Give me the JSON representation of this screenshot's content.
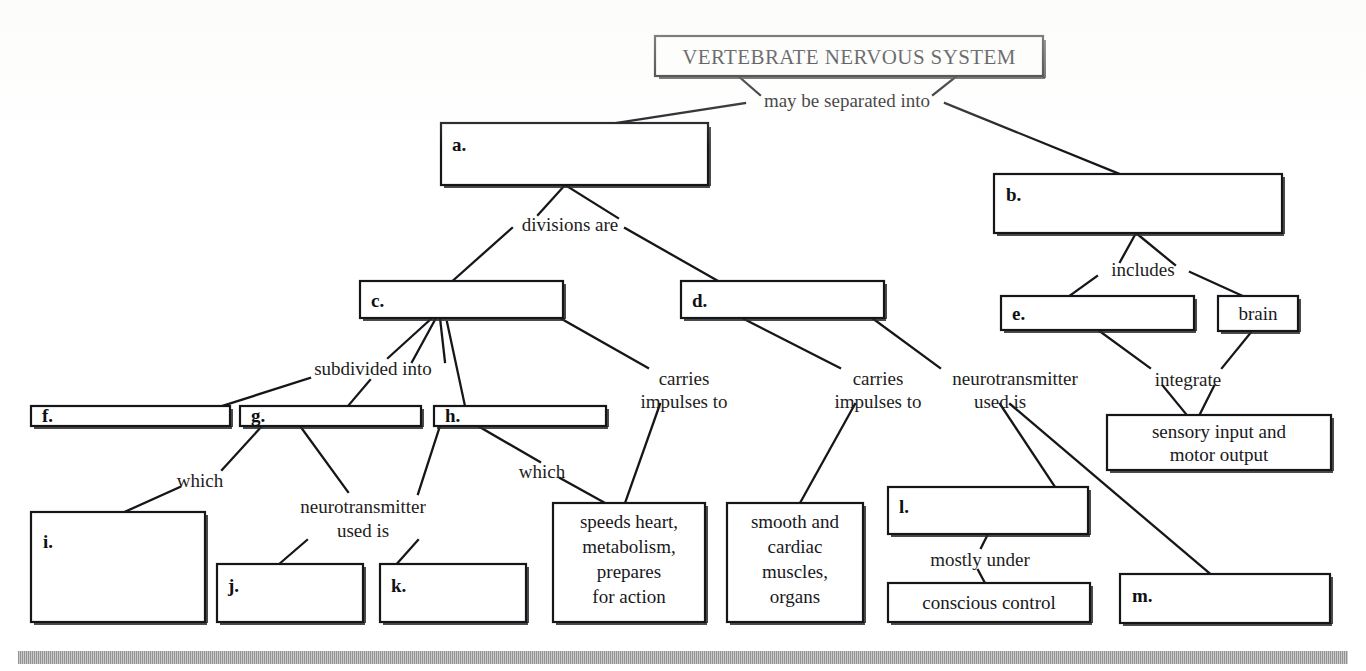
{
  "title": "VERTEBRATE NERVOUS SYSTEM",
  "document": {
    "type": "concept-map-worksheet",
    "footer_rule": true
  },
  "colors": {
    "stroke": "#15161a",
    "text": "#18181b",
    "page_background": "#ffffff",
    "footer_bar": "#9a9a9a"
  },
  "nodes": {
    "root": {
      "text": "VERTEBRATE NERVOUS SYSTEM",
      "key": "",
      "filled": true
    },
    "a": {
      "key": "a.",
      "text": "",
      "filled": false
    },
    "b": {
      "key": "b.",
      "text": "",
      "filled": false
    },
    "c": {
      "key": "c.",
      "text": "",
      "filled": false
    },
    "d": {
      "key": "d.",
      "text": "",
      "filled": false
    },
    "e": {
      "key": "e.",
      "text": "",
      "filled": false
    },
    "brain": {
      "key": "",
      "text": "brain",
      "filled": true
    },
    "f": {
      "key": "f.",
      "text": "",
      "filled": false
    },
    "g": {
      "key": "g.",
      "text": "",
      "filled": false
    },
    "h": {
      "key": "h.",
      "text": "",
      "filled": false
    },
    "i": {
      "key": "i.",
      "text": "",
      "filled": false
    },
    "j": {
      "key": "j.",
      "text": "",
      "filled": false
    },
    "k": {
      "key": "k.",
      "text": "",
      "filled": false
    },
    "l": {
      "key": "l.",
      "text": "",
      "filled": false
    },
    "m": {
      "key": "m.",
      "text": "",
      "filled": false
    },
    "sensory_motor": {
      "key": "",
      "filled": true,
      "lines": [
        "sensory input and",
        "motor output"
      ]
    },
    "speeds_heart": {
      "key": "",
      "filled": true,
      "lines": [
        "speeds heart,",
        "metabolism,",
        "prepares",
        "for action"
      ]
    },
    "smooth_cardiac": {
      "key": "",
      "filled": true,
      "lines": [
        "smooth and",
        "cardiac",
        "muscles,",
        "organs"
      ]
    },
    "conscious_control": {
      "key": "",
      "text": "conscious control",
      "filled": true
    }
  },
  "link_labels": {
    "may_be_separated_into": "may be separated into",
    "divisions_are": "divisions are",
    "includes": "includes",
    "integrate": "integrate",
    "subdivided_into": "subdivided into",
    "carries_impulses_to_1": {
      "line1": "carries",
      "line2": "impulses to"
    },
    "carries_impulses_to_2": {
      "line1": "carries",
      "line2": "impulses to"
    },
    "neurotransmitter_used_is_1": {
      "line1": "neurotransmitter",
      "line2": "used is"
    },
    "neurotransmitter_used_is_2": {
      "line1": "neurotransmitter",
      "line2": "used is"
    },
    "which_1": "which",
    "which_2": "which",
    "mostly_under": "mostly under"
  }
}
